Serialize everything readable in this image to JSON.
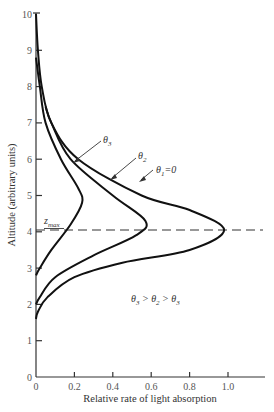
{
  "chart_data": {
    "type": "line",
    "title": "",
    "xlabel": "Relative rate of light absorption",
    "ylabel": "Altitude (arbitrary units)",
    "xlim": [
      0,
      1.1
    ],
    "ylim": [
      0,
      10
    ],
    "x_ticks": [
      "0",
      "0.2",
      "0.4",
      "0.6",
      "0.8",
      "1.0"
    ],
    "x_tick_values": [
      0,
      0.2,
      0.4,
      0.6,
      0.8,
      1.0
    ],
    "y_ticks": [
      "0",
      "1",
      "2",
      "3",
      "4",
      "5",
      "6",
      "7",
      "8",
      "9",
      "10"
    ],
    "y_tick_values": [
      0,
      1,
      2,
      3,
      4,
      5,
      6,
      7,
      8,
      9,
      10
    ],
    "grid": false,
    "legend": null,
    "series": [
      {
        "name": "θ1=0",
        "label_text": "θ",
        "label_sub": "1",
        "label_suffix": "=0",
        "points": [
          [
            0.0,
            10
          ],
          [
            0.01,
            9
          ],
          [
            0.03,
            8
          ],
          [
            0.08,
            7
          ],
          [
            0.22,
            6
          ],
          [
            0.55,
            5
          ],
          [
            0.8,
            4.6
          ],
          [
            0.98,
            4.05
          ],
          [
            0.8,
            3.5
          ],
          [
            0.45,
            3.15
          ],
          [
            0.2,
            2.75
          ],
          [
            0.06,
            2.2
          ],
          [
            0.01,
            1.8
          ],
          [
            0.0,
            1.6
          ]
        ]
      },
      {
        "name": "θ2",
        "label_text": "θ",
        "label_sub": "2",
        "label_suffix": "",
        "points": [
          [
            0.05,
            7.45
          ],
          [
            0.08,
            7
          ],
          [
            0.18,
            6
          ],
          [
            0.4,
            5
          ],
          [
            0.57,
            4.3
          ],
          [
            0.52,
            3.9
          ],
          [
            0.3,
            3.35
          ],
          [
            0.1,
            2.75
          ],
          [
            0.02,
            2.2
          ],
          [
            0.0,
            2.0
          ]
        ]
      },
      {
        "name": "θ3",
        "label_text": "θ",
        "label_sub": "3",
        "label_suffix": "",
        "points": [
          [
            0.0,
            8.8
          ],
          [
            0.02,
            8
          ],
          [
            0.05,
            7
          ],
          [
            0.13,
            6
          ],
          [
            0.22,
            5.2
          ],
          [
            0.24,
            4.8
          ],
          [
            0.18,
            4.2
          ],
          [
            0.08,
            3.5
          ],
          [
            0.02,
            3.0
          ],
          [
            0.0,
            2.8
          ]
        ]
      }
    ],
    "reference_line": {
      "label": "z",
      "label_sub": "max",
      "altitude": 4.05,
      "style": "dashed"
    },
    "annotations": [
      {
        "text": "θ3 > θ2 > θ3",
        "x": 0.52,
        "y": 2.3
      }
    ]
  },
  "labels": {
    "zmax_main": "z",
    "zmax_sub": "max",
    "theta": "θ",
    "inequality": [
      "θ",
      "3",
      " > ",
      "θ",
      "2",
      " > ",
      "θ",
      "3"
    ]
  }
}
